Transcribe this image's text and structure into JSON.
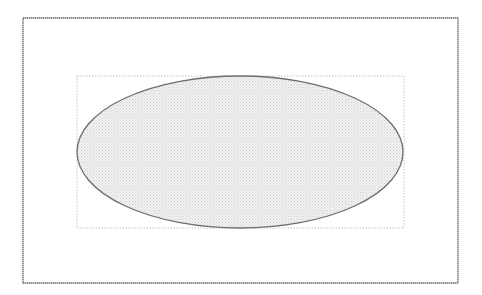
{
  "diagram": {
    "canvas": {
      "width": 482,
      "height": 295,
      "background": "#ffffff"
    },
    "outer_frame": {
      "x": 23,
      "y": 18,
      "width": 435,
      "height": 265,
      "stroke": "#6a6a6a"
    },
    "bounding_box": {
      "x": 77,
      "y": 76,
      "width": 327,
      "height": 152,
      "stroke": "#c4c4c4",
      "style": "dotted"
    },
    "ellipse": {
      "cx": 240,
      "cy": 152,
      "rx": 163,
      "ry": 76,
      "stroke": "#6e6e6e",
      "fill": "#e4e4e4",
      "fill_pattern": "dotted-gray"
    }
  }
}
